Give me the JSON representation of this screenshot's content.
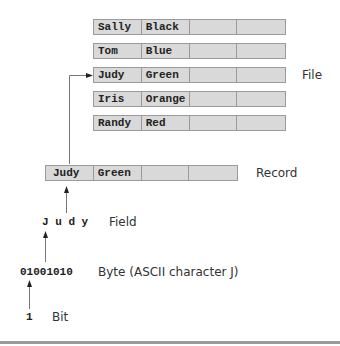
{
  "file": {
    "label": "File",
    "records": [
      {
        "fields": [
          "Sally",
          "Black",
          "",
          ""
        ]
      },
      {
        "fields": [
          "Tom",
          "Blue",
          "",
          ""
        ]
      },
      {
        "fields": [
          "Judy",
          "Green",
          "",
          ""
        ]
      },
      {
        "fields": [
          "Iris",
          "Orange",
          "",
          ""
        ]
      },
      {
        "fields": [
          "Randy",
          "Red",
          "",
          ""
        ]
      }
    ]
  },
  "record": {
    "label": "Record",
    "fields": [
      "Judy",
      "Green",
      "",
      ""
    ]
  },
  "field": {
    "value": "J u d y",
    "label": "Field"
  },
  "byte": {
    "value": "01001010",
    "label": "Byte (ASCII character J)"
  },
  "bit": {
    "value": "1",
    "label": "Bit"
  }
}
